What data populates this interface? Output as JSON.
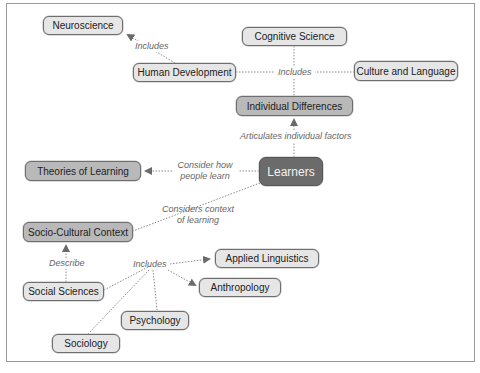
{
  "diagram": {
    "type": "concept-map",
    "central_node": "Learners",
    "nodes": {
      "neuroscience": "Neuroscience",
      "cognitive_science": "Cognitive Science",
      "human_development": "Human Development",
      "culture_language": "Culture and Language",
      "individual_differences": "Individual Differences",
      "learners": "Learners",
      "theories_of_learning": "Theories of Learning",
      "socio_cultural_context": "Socio-Cultural Context",
      "social_sciences": "Social Sciences",
      "applied_linguistics": "Applied Linguistics",
      "anthropology": "Anthropology",
      "psychology": "Psychology",
      "sociology": "Sociology"
    },
    "edge_labels": {
      "includes_neuro": "Includes",
      "includes_center": "Includes",
      "articulates": "Articulates individual factors",
      "consider_how_1": "Consider how",
      "consider_how_2": "people learn",
      "considers_context_1": "Considers context",
      "considers_context_2": "of learning",
      "describe": "Describe",
      "includes_social": "Includes"
    },
    "edges": [
      {
        "from": "Human Development",
        "to": "Neuroscience",
        "label": "Includes"
      },
      {
        "from": "Individual Differences",
        "to": "Human Development",
        "label": "Includes"
      },
      {
        "from": "Individual Differences",
        "to": "Cognitive Science",
        "label": "Includes"
      },
      {
        "from": "Individual Differences",
        "to": "Culture and Language",
        "label": "Includes"
      },
      {
        "from": "Learners",
        "to": "Individual Differences",
        "label": "Articulates individual factors"
      },
      {
        "from": "Learners",
        "to": "Theories of Learning",
        "label": "Consider how people learn"
      },
      {
        "from": "Learners",
        "to": "Socio-Cultural Context",
        "label": "Considers context of learning"
      },
      {
        "from": "Social Sciences",
        "to": "Socio-Cultural Context",
        "label": "Describe"
      },
      {
        "from": "Social Sciences",
        "to": "Applied Linguistics",
        "label": "Includes"
      },
      {
        "from": "Social Sciences",
        "to": "Anthropology",
        "label": "Includes"
      },
      {
        "from": "Social Sciences",
        "to": "Psychology",
        "label": "Includes"
      },
      {
        "from": "Social Sciences",
        "to": "Sociology",
        "label": "Includes"
      }
    ],
    "colors": {
      "node_light": "#e6e6e6",
      "node_mid": "#b9b9b9",
      "node_dark": "#6b6b6b",
      "edge": "#888888",
      "label_text": "#666666"
    }
  }
}
